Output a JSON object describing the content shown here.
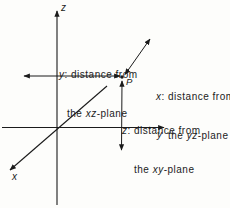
{
  "figure": {
    "background": "#fdfdfb",
    "ink": "#1b1b1b",
    "axes": {
      "x_label": "x",
      "y_label": "y",
      "z_label": "z"
    },
    "point": {
      "label": "P"
    },
    "annotations": {
      "y_distance": {
        "line1_var": "y",
        "line1_text": ": distance from",
        "line2_pre": "the ",
        "line2_var": "xz",
        "line2_post": "-plane"
      },
      "x_distance": {
        "line1_var": "x",
        "line1_text": ": distance from",
        "line2_pre": "the ",
        "line2_var": "yz",
        "line2_post": "-plane"
      },
      "z_distance": {
        "line1_var": "z",
        "line1_text": ": distance from",
        "line2_pre": "the ",
        "line2_var": "xy",
        "line2_post": "-plane"
      }
    },
    "margin_note": {
      "number": "3",
      "fragment": "cu"
    }
  }
}
